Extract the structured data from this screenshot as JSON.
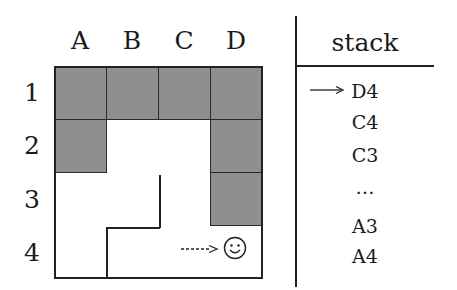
{
  "grid": {
    "columns": [
      "A",
      "B",
      "C",
      "D"
    ],
    "rows": [
      "1",
      "2",
      "3",
      "4"
    ],
    "walls": [
      "A1",
      "B1",
      "C1",
      "D1",
      "A2",
      "D2",
      "D3"
    ],
    "agent": {
      "cell": "D4",
      "icon": "smiley-icon",
      "move_arrow": "dashed-arrow-icon"
    }
  },
  "stack": {
    "title": "stack",
    "pointer_icon": "arrow-right-icon",
    "items": [
      "D4",
      "C4",
      "C3",
      "…",
      "A3",
      "A4"
    ]
  },
  "colors": {
    "wall": "#8f8f8f",
    "line": "#222222",
    "background": "#ffffff"
  }
}
